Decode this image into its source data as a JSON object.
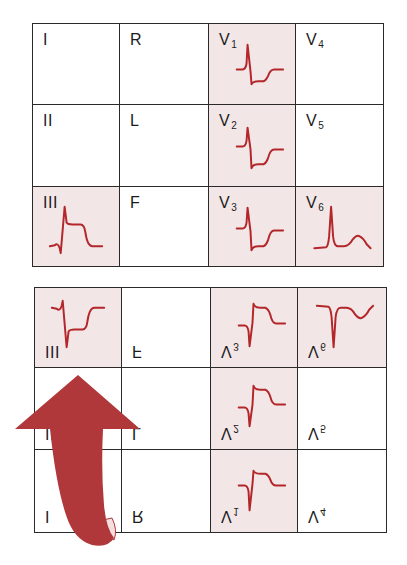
{
  "figure": {
    "colors": {
      "waveform": "#b3262a",
      "shaded_cell": "#f2e6e6",
      "grid_line": "#2a2a2a",
      "arrow": "#b0373a"
    }
  },
  "top_grid": {
    "orientation": "upright",
    "rows": [
      [
        {
          "lead": "I",
          "sub": "",
          "shaded": false,
          "waveform": "none"
        },
        {
          "lead": "R",
          "sub": "",
          "shaded": false,
          "waveform": "none"
        },
        {
          "lead": "V",
          "sub": "1",
          "shaded": true,
          "waveform": "st-elevation-rS"
        },
        {
          "lead": "V",
          "sub": "4",
          "shaded": false,
          "waveform": "none"
        }
      ],
      [
        {
          "lead": "II",
          "sub": "",
          "shaded": false,
          "waveform": "none"
        },
        {
          "lead": "L",
          "sub": "",
          "shaded": false,
          "waveform": "none"
        },
        {
          "lead": "V",
          "sub": "2",
          "shaded": true,
          "waveform": "st-elevation-rS"
        },
        {
          "lead": "V",
          "sub": "5",
          "shaded": false,
          "waveform": "none"
        }
      ],
      [
        {
          "lead": "III",
          "sub": "",
          "shaded": true,
          "waveform": "st-elevation-qR"
        },
        {
          "lead": "F",
          "sub": "",
          "shaded": false,
          "waveform": "none"
        },
        {
          "lead": "V",
          "sub": "3",
          "shaded": true,
          "waveform": "st-elevation-rS"
        },
        {
          "lead": "V",
          "sub": "6",
          "shaded": true,
          "waveform": "tall-R-upright-T"
        }
      ]
    ]
  },
  "bottom_grid": {
    "orientation": "vertically-mirrored",
    "rows": [
      [
        {
          "lead": "III",
          "sub": "",
          "shaded": true,
          "waveform": "mirrored-st-elevation-qR"
        },
        {
          "lead": "F",
          "sub": "",
          "shaded": false,
          "waveform": "none"
        },
        {
          "lead": "V",
          "sub": "3",
          "shaded": true,
          "waveform": "mirrored-st-elevation-rS"
        },
        {
          "lead": "V",
          "sub": "6",
          "shaded": true,
          "waveform": "mirrored-tall-R-upright-T"
        }
      ],
      [
        {
          "lead": "II",
          "sub": "",
          "shaded": false,
          "waveform": "none"
        },
        {
          "lead": "L",
          "sub": "",
          "shaded": false,
          "waveform": "none"
        },
        {
          "lead": "V",
          "sub": "2",
          "shaded": true,
          "waveform": "mirrored-st-elevation-rS"
        },
        {
          "lead": "V",
          "sub": "5",
          "shaded": false,
          "waveform": "none"
        }
      ],
      [
        {
          "lead": "I",
          "sub": "",
          "shaded": false,
          "waveform": "none"
        },
        {
          "lead": "R",
          "sub": "",
          "shaded": false,
          "waveform": "none"
        },
        {
          "lead": "V",
          "sub": "1",
          "shaded": true,
          "waveform": "mirrored-st-elevation-rS"
        },
        {
          "lead": "V",
          "sub": "4",
          "shaded": false,
          "waveform": "none"
        }
      ]
    ]
  },
  "arrow": {
    "direction": "up",
    "style": "curled-ribbon",
    "meaning": "flip-vertical"
  }
}
